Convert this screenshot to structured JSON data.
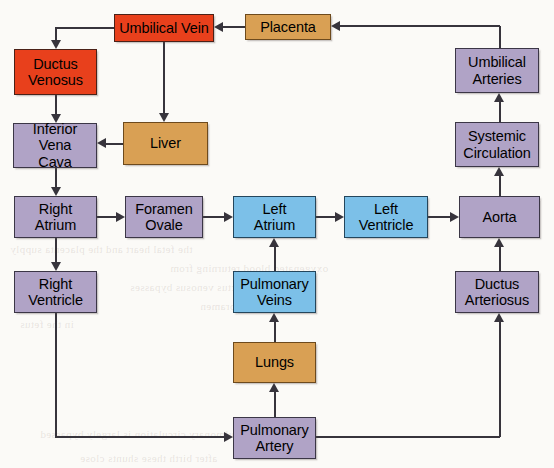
{
  "diagram": {
    "background_color": "#fbfaf7",
    "palette": {
      "oxygenated_red": "#e8401c",
      "organ_tan": "#d9a054",
      "venous_purple": "#b0a3c6",
      "left_heart_blue": "#7cc0e8",
      "line_color": "#37343c"
    },
    "nodes": [
      {
        "id": "umbilical_vein",
        "label": "Umbilical Vein",
        "lines": [
          "Umbilical Vein"
        ],
        "color": "oxygenated_red",
        "x": 114,
        "y": 14,
        "w": 100,
        "h": 28
      },
      {
        "id": "placenta",
        "label": "Placenta",
        "lines": [
          "Placenta"
        ],
        "color": "organ_tan",
        "x": 245,
        "y": 14,
        "w": 86,
        "h": 26
      },
      {
        "id": "ductus_venosus",
        "label": "Ductus Venosus",
        "lines": [
          "Ductus",
          "Venosus"
        ],
        "color": "oxygenated_red",
        "x": 14,
        "y": 49,
        "w": 83,
        "h": 46
      },
      {
        "id": "umbilical_arteries",
        "label": "Umbilical Arteries",
        "lines": [
          "Umbilical",
          "Arteries"
        ],
        "color": "venous_purple",
        "x": 455,
        "y": 48,
        "w": 84,
        "h": 45
      },
      {
        "id": "inferior_vena_cava",
        "label": "Inferior Vena Cava",
        "lines": [
          "Inferior Vena",
          "Cava"
        ],
        "color": "venous_purple",
        "x": 13,
        "y": 123,
        "w": 84,
        "h": 45
      },
      {
        "id": "liver",
        "label": "Liver",
        "lines": [
          "Liver"
        ],
        "color": "organ_tan",
        "x": 123,
        "y": 122,
        "w": 85,
        "h": 43
      },
      {
        "id": "systemic_circulation",
        "label": "Systemic Circulation",
        "lines": [
          "Systemic",
          "Circulation"
        ],
        "color": "venous_purple",
        "x": 455,
        "y": 122,
        "w": 84,
        "h": 45
      },
      {
        "id": "right_atrium",
        "label": "Right Atrium",
        "lines": [
          "Right",
          "Atrium"
        ],
        "color": "venous_purple",
        "x": 14,
        "y": 196,
        "w": 83,
        "h": 42
      },
      {
        "id": "foramen_ovale",
        "label": "Foramen Ovale",
        "lines": [
          "Foramen",
          "Ovale"
        ],
        "color": "venous_purple",
        "x": 125,
        "y": 196,
        "w": 78,
        "h": 42
      },
      {
        "id": "left_atrium",
        "label": "Left Atrium",
        "lines": [
          "Left",
          "Atrium"
        ],
        "color": "left_heart_blue",
        "x": 233,
        "y": 196,
        "w": 83,
        "h": 42
      },
      {
        "id": "left_ventricle",
        "label": "Left Ventricle",
        "lines": [
          "Left",
          "Ventricle"
        ],
        "color": "left_heart_blue",
        "x": 344,
        "y": 196,
        "w": 84,
        "h": 42
      },
      {
        "id": "aorta",
        "label": "Aorta",
        "lines": [
          "Aorta"
        ],
        "color": "venous_purple",
        "x": 459,
        "y": 196,
        "w": 81,
        "h": 42
      },
      {
        "id": "right_ventricle",
        "label": "Right Ventricle",
        "lines": [
          "Right",
          "Ventricle"
        ],
        "color": "venous_purple",
        "x": 14,
        "y": 271,
        "w": 83,
        "h": 42
      },
      {
        "id": "pulmonary_veins",
        "label": "Pulmonary Veins",
        "lines": [
          "Pulmonary",
          "Veins"
        ],
        "color": "left_heart_blue",
        "x": 233,
        "y": 271,
        "w": 83,
        "h": 42
      },
      {
        "id": "ductus_arteriosus",
        "label": "Ductus Arteriosus",
        "lines": [
          "Ductus",
          "Arteriosus"
        ],
        "color": "venous_purple",
        "x": 455,
        "y": 271,
        "w": 84,
        "h": 42
      },
      {
        "id": "lungs",
        "label": "Lungs",
        "lines": [
          "Lungs"
        ],
        "color": "organ_tan",
        "x": 233,
        "y": 342,
        "w": 83,
        "h": 41
      },
      {
        "id": "pulmonary_artery",
        "label": "Pulmonary Artery",
        "lines": [
          "Pulmonary",
          "Artery"
        ],
        "color": "venous_purple",
        "x": 233,
        "y": 417,
        "w": 83,
        "h": 42
      }
    ],
    "edges": [
      {
        "from": "placenta",
        "to": "umbilical_vein"
      },
      {
        "from": "umbilical_vein",
        "to": "ductus_venosus"
      },
      {
        "from": "umbilical_vein",
        "to": "liver"
      },
      {
        "from": "ductus_venosus",
        "to": "inferior_vena_cava"
      },
      {
        "from": "liver",
        "to": "inferior_vena_cava"
      },
      {
        "from": "inferior_vena_cava",
        "to": "right_atrium"
      },
      {
        "from": "right_atrium",
        "to": "foramen_ovale"
      },
      {
        "from": "right_atrium",
        "to": "right_ventricle"
      },
      {
        "from": "foramen_ovale",
        "to": "left_atrium"
      },
      {
        "from": "left_atrium",
        "to": "left_ventricle"
      },
      {
        "from": "left_ventricle",
        "to": "aorta"
      },
      {
        "from": "aorta",
        "to": "systemic_circulation"
      },
      {
        "from": "systemic_circulation",
        "to": "umbilical_arteries"
      },
      {
        "from": "umbilical_arteries",
        "to": "placenta"
      },
      {
        "from": "right_ventricle",
        "to": "pulmonary_artery"
      },
      {
        "from": "pulmonary_artery",
        "to": "lungs"
      },
      {
        "from": "pulmonary_artery",
        "to": "ductus_arteriosus"
      },
      {
        "from": "lungs",
        "to": "pulmonary_veins"
      },
      {
        "from": "pulmonary_veins",
        "to": "left_atrium"
      },
      {
        "from": "ductus_arteriosus",
        "to": "aorta"
      }
    ],
    "bleed_text": [
      {
        "text": "the fetal heart and the placenta supply",
        "x": 10,
        "y": 243
      },
      {
        "text": "oxygenated blood returning from",
        "x": 170,
        "y": 262
      },
      {
        "text": "the ductus venosus bypasses",
        "x": 130,
        "y": 281
      },
      {
        "text": "through the foramen",
        "x": 200,
        "y": 300
      },
      {
        "text": "in the fetus",
        "x": 20,
        "y": 318
      },
      {
        "text": "the pulmonary circulation is largely bypassed",
        "x": 40,
        "y": 428
      },
      {
        "text": "after birth these shunts close",
        "x": 80,
        "y": 452
      }
    ]
  }
}
